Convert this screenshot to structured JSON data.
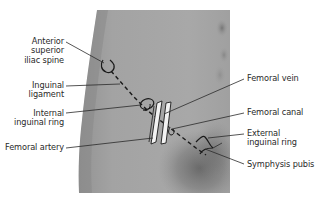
{
  "figure": {
    "colors": {
      "background": "#ffffff",
      "skin_light": "#a9a9a9",
      "skin_mid": "#9a9a9a",
      "skin_shadow": "#7a7a7a",
      "outline": "#1a1a1a",
      "vessel_fill": "#f2f2f2",
      "leader_line": "#2a2a2a",
      "label_text": "#2a2a2a"
    },
    "labels": {
      "asis": {
        "line1": "Anterior",
        "line2": "superior",
        "line3": "iliac spine"
      },
      "inguinal_ligament": {
        "line1": "Inguinal",
        "line2": "ligament"
      },
      "internal_ring": {
        "line1": "Internal",
        "line2": "inguinal ring"
      },
      "femoral_artery": {
        "line1": "Femoral artery"
      },
      "femoral_vein": {
        "line1": "Femoral vein"
      },
      "femoral_canal": {
        "line1": "Femoral canal"
      },
      "external_ring": {
        "line1": "External",
        "line2": "inguinal ring"
      },
      "symphysis_pubis": {
        "line1": "Symphysis pubis"
      }
    }
  }
}
